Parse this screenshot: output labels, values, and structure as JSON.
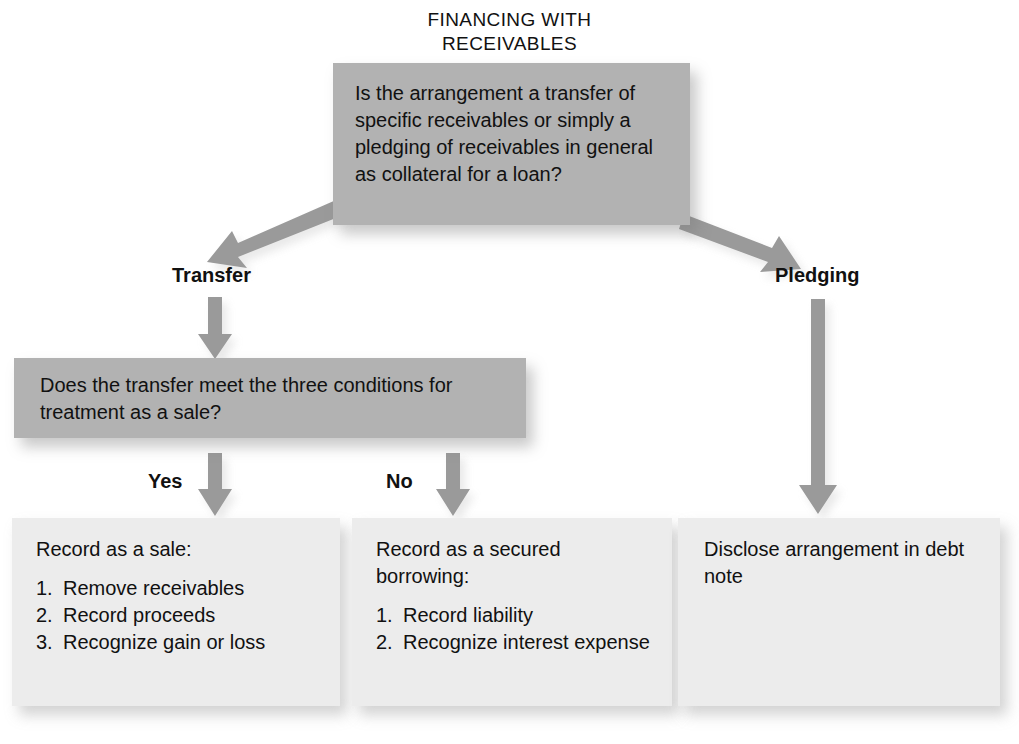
{
  "title": {
    "line1": "FINANCING WITH",
    "line2": "RECEIVABLES"
  },
  "nodes": {
    "decision_main": {
      "text": "Is the arrangement a transfer of specific receivables or simply a pledging of receivables in general as collateral for a loan?",
      "kind": "decision",
      "fill": "#b2b2b2"
    },
    "decision_transfer": {
      "text": "Does the transfer meet the three conditions for treatment as a sale?",
      "kind": "decision",
      "fill": "#b2b2b2"
    },
    "result_sale": {
      "heading": "Record as a sale:",
      "items": [
        {
          "num": "1.",
          "text": "Remove receivables"
        },
        {
          "num": "2.",
          "text": "Record proceeds"
        },
        {
          "num": "3.",
          "text": "Recognize gain or loss"
        }
      ],
      "kind": "result",
      "fill": "#ececec"
    },
    "result_borrowing": {
      "heading": "Record as a secured borrowing:",
      "items": [
        {
          "num": "1.",
          "text": "Record liability"
        },
        {
          "num": "2.",
          "text": "Recognize interest expense"
        }
      ],
      "kind": "result",
      "fill": "#ececec"
    },
    "result_disclose": {
      "heading": "Disclose arrangement in debt note",
      "items": [],
      "kind": "result",
      "fill": "#ececec"
    }
  },
  "edges": {
    "transfer_label": "Transfer",
    "pledging_label": "Pledging",
    "yes_label": "Yes",
    "no_label": "No"
  },
  "colors": {
    "arrow": "#9a9a9a",
    "decision_fill": "#b2b2b2",
    "result_fill": "#ececec",
    "text": "#111111",
    "background": "#ffffff"
  }
}
